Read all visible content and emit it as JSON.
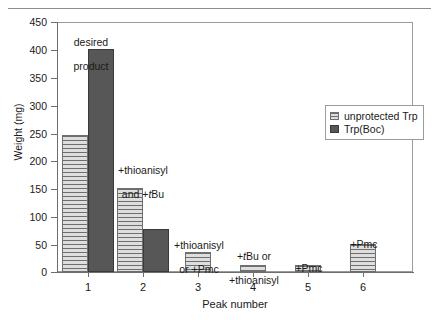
{
  "chart_data": {
    "type": "bar",
    "title": "",
    "xlabel": "Peak number",
    "ylabel": "Weight (mg)",
    "categories": [
      "1",
      "2",
      "3",
      "4",
      "5",
      "6"
    ],
    "ylim": [
      0,
      450
    ],
    "yticks": [
      0,
      50,
      100,
      150,
      200,
      250,
      300,
      350,
      400,
      450
    ],
    "ytick_labels": [
      "0",
      "50",
      "100",
      "150",
      "200",
      "250",
      "300",
      "350",
      "400",
      "450"
    ],
    "grid": false,
    "legend_position": "upper right",
    "series": [
      {
        "name": "unprotected Trp",
        "color": "#c9c9c9",
        "pattern": "horizontal-hatch",
        "values": [
          248,
          152,
          36,
          12,
          12,
          50
        ]
      },
      {
        "name": "Trp(Boc)",
        "color": "#575757",
        "pattern": "solid",
        "values": [
          403,
          77,
          0,
          0,
          0,
          0
        ]
      }
    ],
    "annotations": [
      {
        "peak": "1",
        "line1": "desired",
        "line2": "product",
        "italic_in_line2": ""
      },
      {
        "peak": "2",
        "line1": "+thioanisyl",
        "line2": "and +tBu",
        "italic_in_line2": "t"
      },
      {
        "peak": "3",
        "line1": "+thioanisyl",
        "line2": "or +Pmc",
        "italic_in_line2": ""
      },
      {
        "peak": "4",
        "line1": "+tBu or",
        "line2": "+thioanisyl",
        "italic_in_line2": "t"
      },
      {
        "peak": "5",
        "line1": "+Pmc",
        "line2": "",
        "italic_in_line2": ""
      },
      {
        "peak": "6",
        "line1": "+Pmc",
        "line2": "",
        "italic_in_line2": ""
      }
    ]
  },
  "axis": {
    "y_title": "Weight (mg)",
    "x_title": "Peak number",
    "y_tick_labels": [
      "450",
      "400",
      "350",
      "300",
      "250",
      "200",
      "150",
      "100",
      "50",
      "0"
    ],
    "x_tick_labels": [
      "1",
      "2",
      "3",
      "4",
      "5",
      "6"
    ]
  },
  "legend": {
    "items": [
      {
        "label": "unprotected Trp",
        "swatch": "light-hatched-swatch"
      },
      {
        "label": "Trp(Boc)",
        "swatch": "dark-solid-swatch"
      }
    ]
  },
  "annotations": {
    "peak1_line1": "desired",
    "peak1_line2": "product",
    "peak2_line1": "+thioanisyl",
    "peak2_line2_pre": "and +",
    "peak2_line2_ital": "t",
    "peak2_line2_post": "Bu",
    "peak3_line1": "+thioanisyl",
    "peak3_line2": "or +Pmc",
    "peak4_line1_pre": "+",
    "peak4_line1_ital": "t",
    "peak4_line1_post": "Bu or",
    "peak4_line2": "+thioanisyl",
    "peak5_line1": "+Pmc",
    "peak6_line1": "+Pmc"
  },
  "colors": {
    "series_light": "#c9c9c9",
    "series_dark": "#575757",
    "axis": "#6e6e6e",
    "frame": "#9b9b9b",
    "text": "#1a1a1a"
  }
}
